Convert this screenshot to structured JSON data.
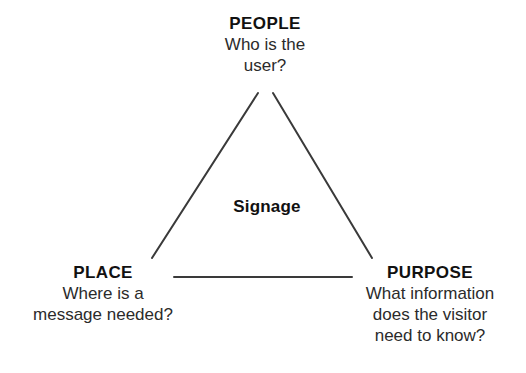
{
  "diagram": {
    "center_label": "Signage",
    "stroke_color": "#3a3a3a",
    "text_color": "#1b1b1b",
    "background_color": "#ffffff",
    "nodes": [
      {
        "id": "people",
        "title": "PEOPLE",
        "description_lines": [
          "Who is the",
          "user?"
        ]
      },
      {
        "id": "place",
        "title": "PLACE",
        "description_lines": [
          "Where is a",
          "message needed?"
        ]
      },
      {
        "id": "purpose",
        "title": "PURPOSE",
        "description_lines": [
          "What information",
          "does the visitor",
          "need to know?"
        ]
      }
    ]
  }
}
